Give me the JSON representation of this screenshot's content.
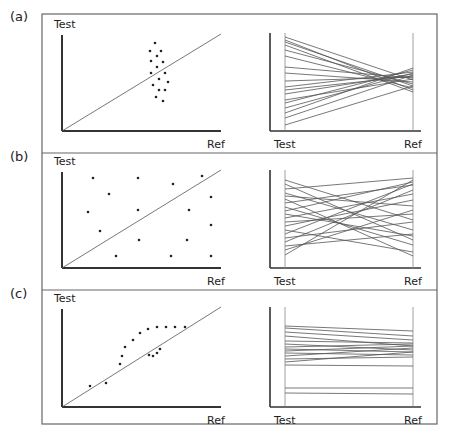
{
  "figure": {
    "frame": {
      "x": 42,
      "y": 14,
      "w": 395,
      "h": 410,
      "separators": [
        153,
        290
      ]
    },
    "colors": {
      "line": "#555555",
      "axis": "#333333",
      "dot": "#222222",
      "frame": "#666666"
    },
    "panels": [
      {
        "label": "(a)",
        "label_pos": [
          10,
          21
        ],
        "scatter": {
          "y_label": "Test",
          "x_label": "Ref",
          "origin": [
            62,
            131
          ],
          "x_end": 221,
          "y_end": 33,
          "identity_end": [
            221,
            34
          ],
          "points": [
            [
              155,
              43
            ],
            [
              150,
              51
            ],
            [
              161,
              51
            ],
            [
              157,
              56
            ],
            [
              151,
              61
            ],
            [
              163,
              62
            ],
            [
              157,
              67
            ],
            [
              151,
              73
            ],
            [
              165,
              73
            ],
            [
              159,
              79
            ],
            [
              168,
              82
            ],
            [
              153,
              85
            ],
            [
              159,
              90
            ],
            [
              165,
              90
            ],
            [
              156,
              97
            ],
            [
              163,
              101
            ]
          ]
        },
        "parallel": {
          "left_label": "Test",
          "right_label": "Ref",
          "outer_axis_x": 270,
          "left_x": 285,
          "right_x": 413,
          "base_y": 131,
          "top_y": 33,
          "lines": [
            [
              37,
              80
            ],
            [
              40,
              90
            ],
            [
              42,
              86
            ],
            [
              45,
              92
            ],
            [
              50,
              84
            ],
            [
              56,
              88
            ],
            [
              67,
              78
            ],
            [
              73,
              82
            ],
            [
              81,
              77
            ],
            [
              87,
              72
            ],
            [
              90,
              76
            ],
            [
              94,
              74
            ],
            [
              100,
              79
            ],
            [
              103,
              70
            ],
            [
              108,
              73
            ],
            [
              113,
              68
            ],
            [
              118,
              75
            ],
            [
              125,
              86
            ]
          ]
        }
      },
      {
        "label": "(b)",
        "label_pos": [
          10,
          161
        ],
        "scatter": {
          "y_label": "Test",
          "x_label": "Ref",
          "origin": [
            62,
            268
          ],
          "x_end": 221,
          "y_end": 170,
          "identity_end": [
            221,
            170
          ],
          "points": [
            [
              93,
              178
            ],
            [
              138,
              178
            ],
            [
              173,
              184
            ],
            [
              202,
              176
            ],
            [
              109,
              194
            ],
            [
              211,
              197
            ],
            [
              88,
              212
            ],
            [
              138,
              210
            ],
            [
              189,
              210
            ],
            [
              100,
              231
            ],
            [
              211,
              225
            ],
            [
              139,
              240
            ],
            [
              187,
              240
            ],
            [
              116,
              256
            ],
            [
              171,
              256
            ],
            [
              211,
              256
            ]
          ]
        },
        "parallel": {
          "left_label": "Test",
          "right_label": "Ref",
          "outer_axis_x": 270,
          "left_x": 285,
          "right_x": 413,
          "base_y": 268,
          "top_y": 170,
          "lines": [
            [
              180,
              220
            ],
            [
              184,
              240
            ],
            [
              189,
              178
            ],
            [
              193,
              230
            ],
            [
              196,
              206
            ],
            [
              199,
              256
            ],
            [
              203,
              185
            ],
            [
              207,
              245
            ],
            [
              211,
              182
            ],
            [
              214,
              236
            ],
            [
              218,
              194
            ],
            [
              222,
              214
            ],
            [
              226,
              200
            ],
            [
              230,
              252
            ],
            [
              234,
              184
            ],
            [
              238,
              222
            ],
            [
              242,
              190
            ],
            [
              246,
              234
            ],
            [
              250,
              210
            ],
            [
              255,
              180
            ]
          ]
        }
      },
      {
        "label": "(c)",
        "label_pos": [
          10,
          298
        ],
        "scatter": {
          "y_label": "Test",
          "x_label": "Ref",
          "origin": [
            62,
            407
          ],
          "x_end": 221,
          "y_end": 307,
          "identity_end": [
            221,
            307
          ],
          "points": [
            [
              90,
              386
            ],
            [
              106,
              383
            ],
            [
              120,
              364
            ],
            [
              122,
              356
            ],
            [
              125,
              347
            ],
            [
              133,
              340
            ],
            [
              140,
              333
            ],
            [
              148,
              329
            ],
            [
              157,
              327
            ],
            [
              166,
              327
            ],
            [
              175,
              327
            ],
            [
              185,
              327
            ],
            [
              149,
              355
            ],
            [
              153,
              356
            ],
            [
              157,
              353
            ],
            [
              160,
              349
            ]
          ]
        },
        "parallel": {
          "left_label": "Test",
          "right_label": "Ref",
          "outer_axis_x": 270,
          "left_x": 285,
          "right_x": 413,
          "base_y": 407,
          "top_y": 307,
          "lines": [
            [
              326,
              331
            ],
            [
              328,
              336
            ],
            [
              332,
              340
            ],
            [
              336,
              346
            ],
            [
              341,
              343
            ],
            [
              344,
              350
            ],
            [
              347,
              344
            ],
            [
              349,
              352
            ],
            [
              351,
              346
            ],
            [
              353,
              355
            ],
            [
              356,
              348
            ],
            [
              359,
              357
            ],
            [
              362,
              352
            ],
            [
              365,
              366
            ],
            [
              388,
              388
            ],
            [
              393,
              394
            ]
          ]
        }
      }
    ]
  }
}
